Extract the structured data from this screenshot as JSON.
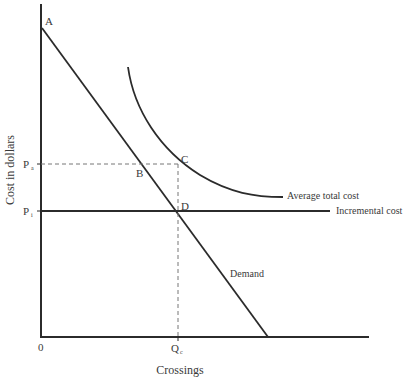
{
  "diagram": {
    "axes": {
      "y_label": "Cost in dollars",
      "x_label": "Crossings",
      "origin_label": "0"
    },
    "price_ticks": [
      {
        "base": "P",
        "sub": "a"
      },
      {
        "base": "P",
        "sub": "i"
      }
    ],
    "quantity_tick": {
      "base": "Q",
      "sub": "c"
    },
    "points": {
      "A": "A",
      "B": "B",
      "C": "C",
      "D": "D"
    },
    "curves": {
      "average_total_cost": "Average total cost",
      "incremental_cost": "Incremental cost",
      "demand": "Demand"
    },
    "colors": {
      "line": "#2b2b2b",
      "text": "#3a3a3a",
      "dashed": "#777777"
    }
  }
}
